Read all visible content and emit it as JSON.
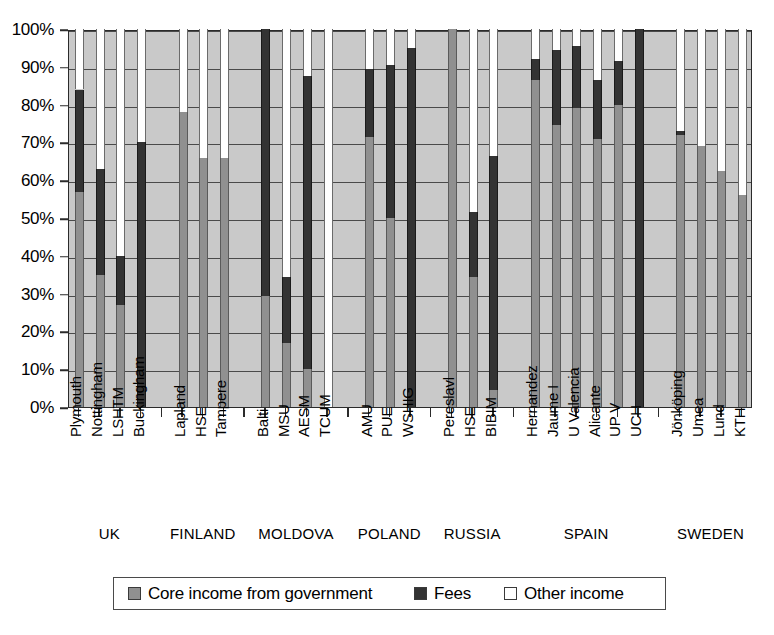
{
  "chart_data": {
    "type": "bar",
    "subtype": "stacked-100-percent",
    "title": "",
    "xlabel": "",
    "ylabel": "",
    "ylim": [
      0,
      100
    ],
    "ytick_labels": [
      "0%",
      "10%",
      "20%",
      "30%",
      "40%",
      "50%",
      "60%",
      "70%",
      "80%",
      "90%",
      "100%"
    ],
    "ytick_values": [
      0,
      10,
      20,
      30,
      40,
      50,
      60,
      70,
      80,
      90,
      100
    ],
    "grid": true,
    "legend_position": "bottom",
    "legend": [
      {
        "label": "Core income from government",
        "color": "#909090",
        "key": "core"
      },
      {
        "label": "Fees",
        "color": "#333333",
        "key": "fees"
      },
      {
        "label": "Other income",
        "color": "#ffffff",
        "key": "other"
      }
    ],
    "series": [
      {
        "name": "Core income from government",
        "color": "#909090",
        "values": [
          57,
          35,
          27,
          0,
          78,
          66,
          66,
          29.5,
          17,
          10,
          0,
          71.5,
          50,
          0,
          100,
          34.5,
          4.5,
          86.5,
          74.5,
          79,
          71,
          80,
          0,
          72,
          69,
          62.5,
          56
        ]
      },
      {
        "name": "Fees",
        "color": "#333333",
        "values": [
          27,
          28,
          13,
          70,
          0,
          0,
          0,
          70.5,
          17.5,
          77.5,
          0,
          18,
          40.5,
          95,
          0,
          17,
          62,
          5.5,
          20,
          16.5,
          15.5,
          11.5,
          100,
          1,
          0,
          0,
          0
        ]
      },
      {
        "name": "Other income",
        "color": "#ffffff",
        "values": [
          16,
          37,
          60,
          30,
          22,
          34,
          34,
          0,
          65.5,
          12.5,
          100,
          10.5,
          9.5,
          5,
          0,
          48.5,
          33.5,
          8,
          5.5,
          4.5,
          13.5,
          8.5,
          0,
          27,
          31,
          37.5,
          44
        ]
      }
    ],
    "categories": [
      "Plymouth",
      "Nottingham",
      "LSHTM",
      "Buckingham",
      "Lapland",
      "HSE",
      "Tampere",
      "Balti",
      "MSU",
      "AESM",
      "TCUM",
      "AMU",
      "PUE",
      "WSHIG",
      "Pereslavl",
      "HSE",
      "BIBIM",
      "Hernandez",
      "Jaume I",
      "U Valencia",
      "Alicante",
      "UP V",
      "UCH",
      "Jönköping",
      "Umea",
      "Lund",
      "KTH"
    ],
    "groups": [
      {
        "label": "UK",
        "members": [
          "Plymouth",
          "Nottingham",
          "LSHTM",
          "Buckingham"
        ]
      },
      {
        "label": "FINLAND",
        "members": [
          "Lapland",
          "HSE",
          "Tampere"
        ]
      },
      {
        "label": "MOLDOVA",
        "members": [
          "Balti",
          "MSU",
          "AESM",
          "TCUM"
        ]
      },
      {
        "label": "POLAND",
        "members": [
          "AMU",
          "PUE",
          "WSHIG"
        ]
      },
      {
        "label": "RUSSIA",
        "members": [
          "Pereslavl",
          "HSE",
          "BIBIM"
        ]
      },
      {
        "label": "SPAIN",
        "members": [
          "Hernandez",
          "Jaume I",
          "U Valencia",
          "Alicante",
          "UP V",
          "UCH"
        ]
      },
      {
        "label": "SWEDEN",
        "members": [
          "Jönköping",
          "Umea",
          "Lund",
          "KTH"
        ]
      }
    ]
  },
  "colors": {
    "core": "#909090",
    "fees": "#333333",
    "other": "#ffffff",
    "plot_background": "#c9c9c9",
    "axis": "#2b2b2b"
  }
}
